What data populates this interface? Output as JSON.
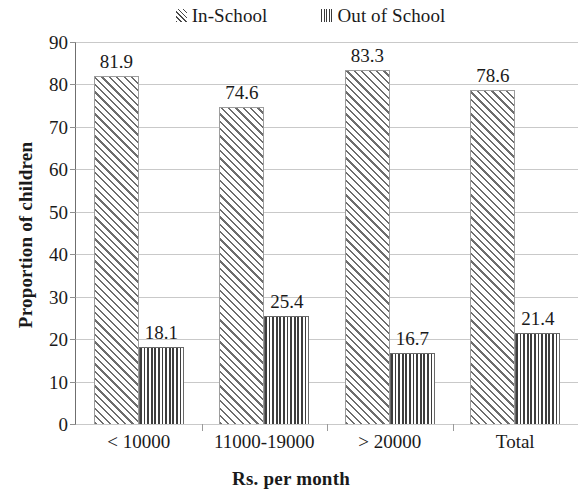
{
  "chart_data": {
    "type": "bar",
    "title": "",
    "xlabel": "Rs. per month",
    "ylabel": "Proportion of children",
    "categories": [
      "< 10000",
      "11000-19000",
      "> 20000",
      "Total"
    ],
    "series": [
      {
        "name": "In-School",
        "values": [
          81.9,
          74.6,
          83.3,
          78.6
        ],
        "pattern": "diagonal-hatch"
      },
      {
        "name": "Out of School",
        "values": [
          18.1,
          25.4,
          16.7,
          21.4
        ],
        "pattern": "vertical-lines"
      }
    ],
    "ylim": [
      0,
      90
    ],
    "yticks": [
      0,
      10,
      20,
      30,
      40,
      50,
      60,
      70,
      80,
      90
    ],
    "ytick_labels": [
      "0",
      "10",
      "20",
      "30",
      "40",
      "50",
      "60",
      "70",
      "80",
      "90"
    ],
    "data_labels": [
      [
        "81.9",
        "74.6",
        "83.3",
        "78.6"
      ],
      [
        "18.1",
        "25.4",
        "16.7",
        "21.4"
      ]
    ],
    "grid": true,
    "grid_axis": "y",
    "legend_position": "top",
    "colors": {
      "grid": "#c9c9c9",
      "axis": "#8a8a8a",
      "in_school_hatch": "#6d6d6d",
      "out_school_hatch": "#3d3d3d",
      "text": "#1a1a1a",
      "background": "#ffffff"
    }
  },
  "legend": {
    "entries": [
      {
        "label": "In-School",
        "swatch": "diagonal-hatch-swatch"
      },
      {
        "label": "Out of School",
        "swatch": "vertical-lines-swatch"
      }
    ]
  }
}
